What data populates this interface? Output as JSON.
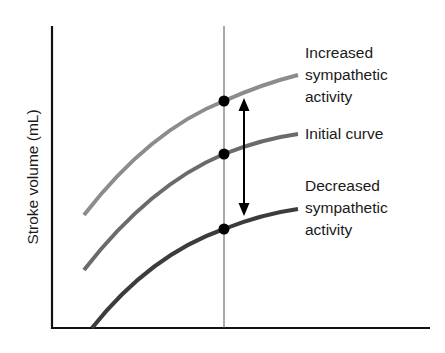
{
  "diagram": {
    "y_axis_label": "Stroke volume (mL)",
    "x_axis_label": "",
    "curves": [
      {
        "id": "increased",
        "label_lines": [
          "Increased",
          "sympathetic",
          "activity"
        ],
        "color": "#8c8c8c",
        "path": "M84,215 Q150,130 224,101 Q262,84 298,75"
      },
      {
        "id": "initial",
        "label_lines": [
          "Initial curve"
        ],
        "color": "#6b6b6b",
        "path": "M84,270 Q150,185 224,154 Q262,139 298,134"
      },
      {
        "id": "decreased",
        "label_lines": [
          "Decreased",
          "sympathetic",
          "activity"
        ],
        "color": "#3c3c3c",
        "path": "M92,328 Q150,255 224,229 Q262,214 298,209"
      }
    ],
    "points": [
      {
        "curve": "increased",
        "x": 224,
        "y": 101
      },
      {
        "curve": "initial",
        "x": 224,
        "y": 154
      },
      {
        "curve": "decreased",
        "x": 224,
        "y": 229
      }
    ],
    "arrow": {
      "x": 244,
      "y_top": 99,
      "y_bottom": 215,
      "style": "double-headed"
    },
    "reference_line_x": 224
  }
}
